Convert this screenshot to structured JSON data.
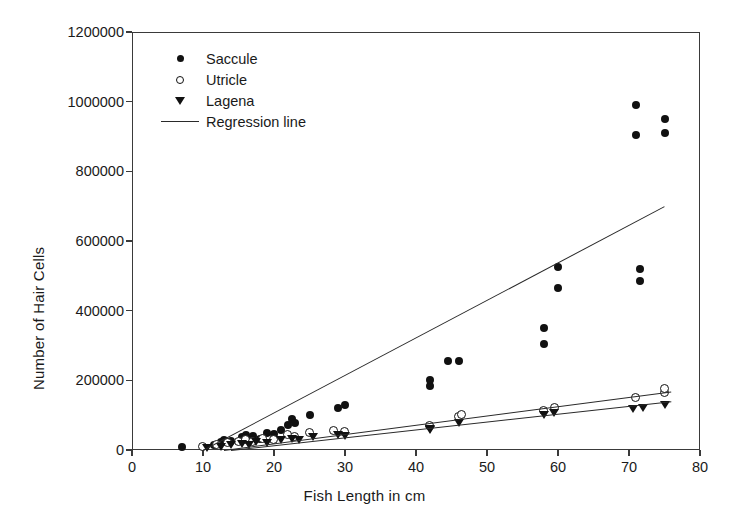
{
  "chart_data": {
    "type": "scatter",
    "title": "",
    "xlabel": "Fish Length in cm",
    "ylabel": "Number of Hair Cells",
    "xlim": [
      0,
      80
    ],
    "ylim": [
      0,
      1200000
    ],
    "xticks": [
      0,
      10,
      20,
      30,
      40,
      50,
      60,
      70,
      80
    ],
    "yticks": [
      0,
      200000,
      400000,
      600000,
      800000,
      1000000,
      1200000
    ],
    "grid": false,
    "legend_position": "upper-left-inside",
    "legend": [
      {
        "label": "Saccule",
        "marker": "filled-circle"
      },
      {
        "label": "Utricle",
        "marker": "open-circle"
      },
      {
        "label": "Lagena",
        "marker": "filled-triangle-down"
      },
      {
        "label": "Regression line",
        "marker": "line"
      }
    ],
    "series": [
      {
        "name": "Saccule",
        "marker": "filled-circle",
        "points": [
          [
            7,
            9000
          ],
          [
            11.5,
            14000
          ],
          [
            12.5,
            22000
          ],
          [
            13,
            30000
          ],
          [
            14,
            26000
          ],
          [
            15.5,
            36000
          ],
          [
            16,
            44000
          ],
          [
            16.5,
            30000
          ],
          [
            17,
            40000
          ],
          [
            18,
            33000
          ],
          [
            19,
            50000
          ],
          [
            20,
            46000
          ],
          [
            21,
            58000
          ],
          [
            22,
            72000
          ],
          [
            22.5,
            88000
          ],
          [
            23,
            78000
          ],
          [
            25,
            100000
          ],
          [
            29,
            120000
          ],
          [
            30,
            128000
          ],
          [
            42,
            185000
          ],
          [
            42,
            200000
          ],
          [
            44.5,
            255000
          ],
          [
            46,
            255000
          ],
          [
            58,
            305000
          ],
          [
            58,
            350000
          ],
          [
            60,
            465000
          ],
          [
            60,
            525000
          ],
          [
            71,
            905000
          ],
          [
            71,
            990000
          ],
          [
            71.5,
            485000
          ],
          [
            71.5,
            520000
          ],
          [
            75,
            910000
          ],
          [
            75,
            950000
          ]
        ]
      },
      {
        "name": "Utricle",
        "marker": "open-circle",
        "points": [
          [
            10,
            8000
          ],
          [
            12,
            15000
          ],
          [
            13.5,
            20000
          ],
          [
            15,
            24000
          ],
          [
            16,
            28000
          ],
          [
            17,
            24000
          ],
          [
            18.5,
            33000
          ],
          [
            20,
            30000
          ],
          [
            22,
            42000
          ],
          [
            23,
            38000
          ],
          [
            25,
            48000
          ],
          [
            28.5,
            55000
          ],
          [
            30,
            52000
          ],
          [
            42,
            70000
          ],
          [
            46,
            95000
          ],
          [
            46.5,
            100000
          ],
          [
            58,
            112000
          ],
          [
            59.5,
            122000
          ],
          [
            71,
            150000
          ],
          [
            75,
            165000
          ],
          [
            75,
            175000
          ]
        ]
      },
      {
        "name": "Lagena",
        "marker": "filled-triangle-down",
        "points": [
          [
            10.5,
            5000
          ],
          [
            12.5,
            10000
          ],
          [
            14,
            14000
          ],
          [
            15.5,
            18000
          ],
          [
            16.5,
            15000
          ],
          [
            17.5,
            22000
          ],
          [
            19,
            20000
          ],
          [
            21,
            28000
          ],
          [
            22.5,
            32000
          ],
          [
            23.5,
            30000
          ],
          [
            25.5,
            38000
          ],
          [
            29,
            42000
          ],
          [
            30,
            40000
          ],
          [
            42,
            58000
          ],
          [
            42,
            60000
          ],
          [
            46,
            78000
          ],
          [
            58,
            100000
          ],
          [
            59.5,
            105000
          ],
          [
            70.5,
            118000
          ],
          [
            72,
            122000
          ],
          [
            75,
            128000
          ]
        ]
      }
    ],
    "regression_lines": [
      {
        "name": "Saccule regression",
        "x0": 10,
        "y0": 0,
        "x1": 75,
        "y1": 700000
      },
      {
        "name": "Utricle regression",
        "x0": 13,
        "y0": 0,
        "x1": 76,
        "y1": 168000
      },
      {
        "name": "Lagena regression",
        "x0": 14,
        "y0": 0,
        "x1": 76,
        "y1": 140000
      }
    ]
  }
}
